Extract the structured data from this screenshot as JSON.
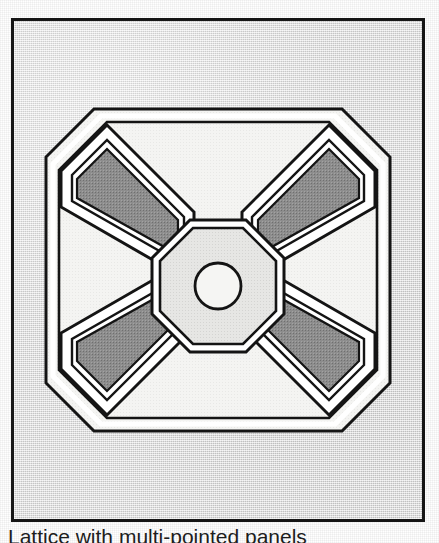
{
  "document": {
    "kind": "scanned-book-figure",
    "caption": "Lattice with multi-pointed panels",
    "caption_note": "clipped at bottom edge of page"
  },
  "plate": {
    "border_color": "#161616",
    "background_color": "#d9d9d9",
    "label": "illustration-plate"
  },
  "figure": {
    "title": "Lattice with multi-pointed panels",
    "colors": {
      "outline": "#141414",
      "arm_fill": "#8b8b8b",
      "panel_fill": "#f2f2f0",
      "highlight": "#ffffff",
      "center_fill": "#e2e2e0",
      "circle_fill": "#f4f4f2"
    },
    "parts": [
      {
        "name": "outer-octagon-frame",
        "shape": "octagon"
      },
      {
        "name": "diagonal-arm-top-left",
        "shape": "tapered-bar"
      },
      {
        "name": "diagonal-arm-top-right",
        "shape": "tapered-bar"
      },
      {
        "name": "diagonal-arm-bottom-left",
        "shape": "tapered-bar"
      },
      {
        "name": "diagonal-arm-bottom-right",
        "shape": "tapered-bar"
      },
      {
        "name": "center-octagon",
        "shape": "octagon"
      },
      {
        "name": "center-circle",
        "shape": "circle"
      }
    ],
    "geometry": {
      "outer_octagon_span_px": 350,
      "center_octagon_span_px": 106,
      "center_circle_radius_px": 23,
      "arm_count": 4
    }
  }
}
